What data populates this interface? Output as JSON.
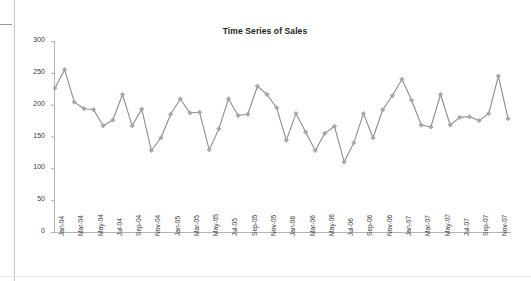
{
  "chart_data": {
    "type": "line",
    "title": "Time Series of Sales",
    "xlabel": "",
    "ylabel": "",
    "ylim": [
      0,
      300
    ],
    "yticks": [
      0,
      50,
      100,
      150,
      200,
      250,
      300
    ],
    "grid": false,
    "legend": "none",
    "marker": "diamond",
    "line_color": "#8c8c8c",
    "marker_color": "#a6a6a6",
    "axis_color": "#b0b0b0",
    "x": [
      "Jan-04",
      "Feb-04",
      "Mar-04",
      "Apr-04",
      "May-04",
      "Jun-04",
      "Jul-04",
      "Aug-04",
      "Sep-04",
      "Oct-04",
      "Nov-04",
      "Dec-04",
      "Jan-05",
      "Feb-05",
      "Mar-05",
      "Apr-05",
      "May-05",
      "Jun-05",
      "Jul-05",
      "Aug-05",
      "Sep-05",
      "Oct-05",
      "Nov-05",
      "Dec-05",
      "Jan-06",
      "Feb-06",
      "Mar-06",
      "Apr-06",
      "May-06",
      "Jun-06",
      "Jul-06",
      "Aug-06",
      "Sep-06",
      "Oct-06",
      "Nov-06",
      "Dec-06",
      "Jan-07",
      "Feb-07",
      "Mar-07",
      "Apr-07",
      "May-07",
      "Jun-07",
      "Jul-07",
      "Aug-07",
      "Sep-07",
      "Oct-07",
      "Nov-07",
      "Dec-07"
    ],
    "xtick_labels": [
      "Jan-04",
      "Mar-04",
      "May-04",
      "Jul-04",
      "Sep-04",
      "Nov-04",
      "Jan-05",
      "Mar-05",
      "May-05",
      "Jul-05",
      "Sep-05",
      "Nov-05",
      "Jan-06",
      "Mar-06",
      "May-06",
      "Jul-06",
      "Sep-06",
      "Nov-06",
      "Jan-07",
      "Mar-07",
      "May-07",
      "Jul-07",
      "Sep-07",
      "Nov-07"
    ],
    "xtick_indices": [
      0,
      2,
      4,
      6,
      8,
      10,
      12,
      14,
      16,
      18,
      20,
      22,
      24,
      26,
      28,
      30,
      32,
      34,
      36,
      38,
      40,
      42,
      44,
      46
    ],
    "values": [
      226,
      255,
      204,
      194,
      192,
      167,
      176,
      216,
      167,
      193,
      128,
      148,
      185,
      209,
      187,
      188,
      129,
      162,
      209,
      183,
      185,
      229,
      216,
      195,
      144,
      186,
      157,
      128,
      155,
      166,
      110,
      140,
      186,
      148,
      192,
      214,
      240,
      207,
      168,
      165,
      216,
      168,
      180,
      181,
      175,
      186,
      245,
      178
    ],
    "series_name": "Sales"
  }
}
